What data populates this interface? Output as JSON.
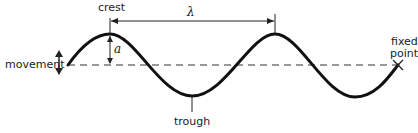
{
  "diagram": {
    "type": "transverse-wave",
    "labels": {
      "crest": "crest",
      "trough": "trough",
      "movement": "movement",
      "fixed_point_line1": "fixed",
      "fixed_point_line2": "point",
      "amplitude_symbol": "a",
      "wavelength_symbol": "λ"
    },
    "colors": {
      "wave": "#111111",
      "text": "#222222",
      "baseline": "#333333"
    }
  }
}
